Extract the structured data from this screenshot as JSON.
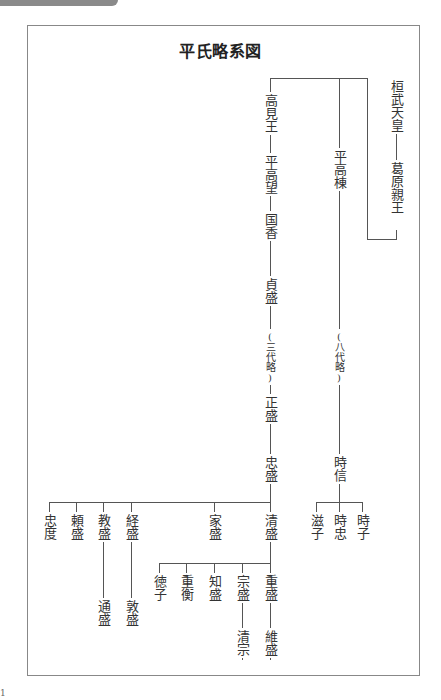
{
  "header": {
    "title": "平氏略系図"
  },
  "diagram": {
    "type": "family-tree",
    "orientation": "vertical-japanese",
    "people": {
      "kanmu": "桓武天皇",
      "kazurahara": "葛原親王",
      "takami": "高見王",
      "takamochi": "平高望",
      "kunika": "国香",
      "sadamori": "貞盛",
      "omit3": "(三代略)",
      "masamori": "正盛",
      "tadamori": "忠盛",
      "takamune": "平高棟",
      "omit8": "(八代略)",
      "tokinobu": "時信",
      "shigeko": "滋子",
      "tokitada": "時忠",
      "tokiko": "時子",
      "tadanori": "忠度",
      "yorimori": "頼盛",
      "norimori": "教盛",
      "tsunemori": "経盛",
      "iemori": "家盛",
      "kiyomori": "清盛",
      "michimori": "通盛",
      "atsumori": "敦盛",
      "tokuko": "徳子",
      "shigehira": "重衡",
      "tomomori": "知盛",
      "munemori": "宗盛",
      "shigemori": "重盛",
      "kiyomune": "清宗",
      "koremori": "維盛"
    },
    "relations": [
      [
        "桓武天皇",
        "葛原親王"
      ],
      [
        "葛原親王",
        "高見王"
      ],
      [
        "葛原親王",
        "平高棟"
      ],
      [
        "高見王",
        "平高望"
      ],
      [
        "平高望",
        "国香"
      ],
      [
        "国香",
        "貞盛"
      ],
      [
        "貞盛",
        "正盛"
      ],
      [
        "正盛",
        "忠盛"
      ],
      [
        "平高棟",
        "時信"
      ],
      [
        "時信",
        "滋子"
      ],
      [
        "時信",
        "時忠"
      ],
      [
        "時信",
        "時子"
      ],
      [
        "忠盛",
        "忠度"
      ],
      [
        "忠盛",
        "頼盛"
      ],
      [
        "忠盛",
        "教盛"
      ],
      [
        "忠盛",
        "経盛"
      ],
      [
        "忠盛",
        "家盛"
      ],
      [
        "忠盛",
        "清盛"
      ],
      [
        "教盛",
        "通盛"
      ],
      [
        "経盛",
        "敦盛"
      ],
      [
        "清盛",
        "徳子"
      ],
      [
        "清盛",
        "重衡"
      ],
      [
        "清盛",
        "知盛"
      ],
      [
        "清盛",
        "宗盛"
      ],
      [
        "清盛",
        "重盛"
      ],
      [
        "宗盛",
        "清宗"
      ],
      [
        "重盛",
        "維盛"
      ]
    ]
  },
  "footer": {
    "mark": "1"
  }
}
